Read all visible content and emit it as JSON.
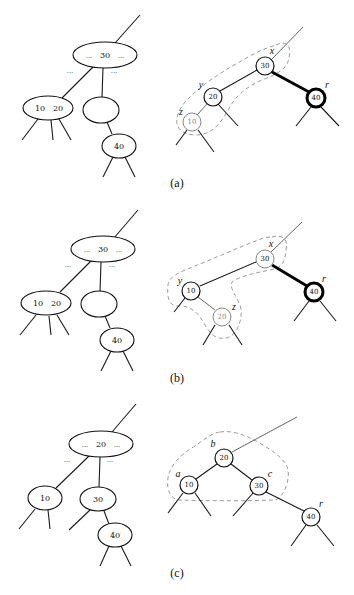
{
  "figure": {
    "panels": [
      {
        "caption": "(a)",
        "btree": {
          "top": {
            "left_dots": "...",
            "key": "30",
            "right_dots": "..."
          },
          "edge_dots_left": "...",
          "edge_dots_right": "...",
          "left_child_keys": [
            "10",
            "20"
          ],
          "middle_child_keys": [],
          "grandchild_key": "40"
        },
        "rbtree": {
          "nodes": [
            {
              "label": "x",
              "key": "30",
              "style": "normal"
            },
            {
              "label": "y",
              "key": "20",
              "style": "normal"
            },
            {
              "label": "z",
              "key": "10",
              "style": "gray"
            },
            {
              "label": "r",
              "key": "40",
              "style": "bold"
            }
          ]
        }
      },
      {
        "caption": "(b)",
        "btree": {
          "top": {
            "left_dots": "...",
            "key": "30",
            "right_dots": "..."
          },
          "edge_dots_left": "...",
          "edge_dots_right": "...",
          "left_child_keys": [
            "10",
            "20"
          ],
          "middle_child_keys": [],
          "grandchild_key": "40"
        },
        "rbtree": {
          "nodes": [
            {
              "label": "x",
              "key": "30",
              "style": "normal"
            },
            {
              "label": "y",
              "key": "10",
              "style": "normal"
            },
            {
              "label": "z",
              "key": "20",
              "style": "gray"
            },
            {
              "label": "r",
              "key": "40",
              "style": "bold"
            }
          ]
        }
      },
      {
        "caption": "(c)",
        "btree": {
          "top": {
            "left_dots": "...",
            "key": "20",
            "right_dots": "..."
          },
          "edge_dots_left": "...",
          "edge_dots_right": "...",
          "left_child_keys": [
            "10"
          ],
          "middle_child_keys": [
            "30"
          ],
          "grandchild_key": "40"
        },
        "rbtree": {
          "nodes": [
            {
              "label": "b",
              "key": "20",
              "style": "normal"
            },
            {
              "label": "a",
              "key": "10",
              "style": "normal"
            },
            {
              "label": "c",
              "key": "30",
              "style": "normal"
            },
            {
              "label": "r",
              "key": "40",
              "style": "normal"
            }
          ]
        }
      }
    ]
  }
}
